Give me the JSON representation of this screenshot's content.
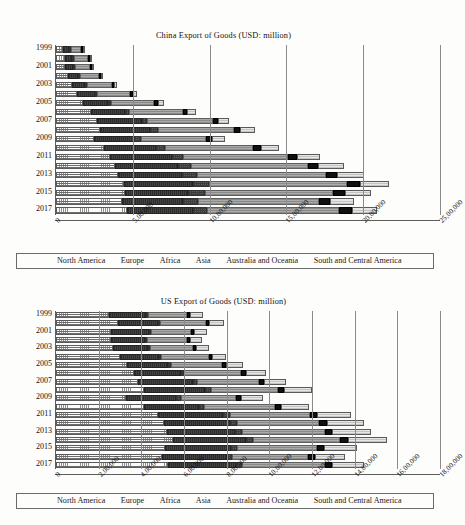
{
  "series_names": [
    "North America",
    "Europe",
    "Africa",
    "Asia",
    "Australia and Oceania",
    "South and Central America"
  ],
  "series_keys": [
    "north-america",
    "europe",
    "africa",
    "asia",
    "australia-oceania",
    "south-central-america"
  ],
  "legend": {
    "items": [
      {
        "label": "North America",
        "key": "north-america"
      },
      {
        "label": "Europe",
        "key": "europe"
      },
      {
        "label": "Africa",
        "key": "africa"
      },
      {
        "label": "Asia",
        "key": "asia"
      },
      {
        "label": "Australia and Oceania",
        "key": "australia-oceania"
      },
      {
        "label": "South and Central America",
        "key": "south-central-america"
      }
    ]
  },
  "chart_data": [
    {
      "id": "china-export",
      "type": "bar",
      "orientation": "horizontal",
      "stacked": true,
      "title": "China Export of Goods (USD: million)",
      "xlabel": "",
      "ylabel": "",
      "xlim": [
        0,
        2500000
      ],
      "xticks": [
        0,
        500000,
        1000000,
        1500000,
        2000000,
        2500000
      ],
      "xtick_labels": [
        "0",
        "5,00,000",
        "10,00,000",
        "15,00,000",
        "20,00,000",
        "25,00,000"
      ],
      "grid": true,
      "legend_position": "bottom",
      "categories": [
        1999,
        2000,
        2001,
        2002,
        2003,
        2004,
        2005,
        2006,
        2007,
        2008,
        2009,
        2010,
        2011,
        2012,
        2013,
        2014,
        2015,
        2016,
        2017
      ],
      "ytick_labels": [
        "1999",
        "2001",
        "2003",
        "2005",
        "2007",
        "2009",
        "2011",
        "2013",
        "2015",
        "2017"
      ],
      "series": [
        {
          "name": "North America",
          "values": [
            45000,
            58000,
            60000,
            78000,
            102000,
            135000,
            177000,
            230000,
            268000,
            285000,
            246000,
            312000,
            350000,
            382000,
            403000,
            440000,
            450000,
            430000,
            460000
          ]
        },
        {
          "name": "Europe",
          "values": [
            38000,
            48000,
            50000,
            66000,
            88000,
            120000,
            163000,
            218000,
            290000,
            330000,
            260000,
            340000,
            406000,
            412000,
            420000,
            450000,
            412000,
            400000,
            430000
          ]
        },
        {
          "name": "Africa",
          "values": [
            4000,
            5000,
            6000,
            7000,
            10000,
            14000,
            19000,
            27000,
            37000,
            51000,
            48000,
            60000,
            73000,
            85000,
            93000,
            106000,
            109000,
            92000,
            95000
          ]
        },
        {
          "name": "Asia",
          "values": [
            70000,
            92000,
            96000,
            122000,
            160000,
            215000,
            282000,
            350000,
            425000,
            490000,
            420000,
            570000,
            680000,
            760000,
            840000,
            900000,
            830000,
            790000,
            860000
          ]
        },
        {
          "name": "Australia and Oceania",
          "values": [
            5000,
            6000,
            7000,
            9000,
            12000,
            16000,
            22000,
            29000,
            36000,
            44000,
            39000,
            52000,
            62000,
            70000,
            76000,
            82000,
            80000,
            74000,
            80000
          ]
        },
        {
          "name": "South and Central America",
          "values": [
            8000,
            10000,
            11000,
            14000,
            20000,
            28000,
            40000,
            55000,
            73000,
            97000,
            85000,
            120000,
            150000,
            165000,
            175000,
            190000,
            172000,
            155000,
            168000
          ]
        }
      ],
      "totals": [
        170000,
        219000,
        230000,
        296000,
        392000,
        528000,
        703000,
        909000,
        1129000,
        1297000,
        1098000,
        1454000,
        1721000,
        1874000,
        2007000,
        2168000,
        2053000,
        1941000,
        2093000
      ]
    },
    {
      "id": "us-export",
      "type": "bar",
      "orientation": "horizontal",
      "stacked": true,
      "title": "US Export of Goods (USD: million)",
      "xlabel": "",
      "ylabel": "",
      "xlim": [
        0,
        1800000
      ],
      "xticks": [
        0,
        200000,
        400000,
        600000,
        800000,
        1000000,
        1200000,
        1400000,
        1600000,
        1800000
      ],
      "xtick_labels": [
        "0",
        "2,00,000",
        "4,00,000",
        "6,00,000",
        "8,00,000",
        "10,00,000",
        "12,00,000",
        "14,00,000",
        "16,00,000",
        "18,00,000"
      ],
      "grid": true,
      "legend_position": "bottom",
      "categories": [
        1999,
        2000,
        2001,
        2002,
        2003,
        2004,
        2005,
        2006,
        2007,
        2008,
        2009,
        2010,
        2011,
        2012,
        2013,
        2014,
        2015,
        2016,
        2017
      ],
      "ytick_labels": [
        "1999",
        "2001",
        "2003",
        "2005",
        "2007",
        "2009",
        "2011",
        "2013",
        "2015",
        "2017"
      ],
      "series": [
        {
          "name": "North America",
          "values": [
            250000,
            291000,
            260000,
            259000,
            267000,
            301000,
            332000,
            364000,
            385000,
            412000,
            330000,
            412000,
            479000,
            505000,
            519000,
            548000,
            513000,
            498000,
            525000
          ]
        },
        {
          "name": "Europe",
          "values": [
            170000,
            186000,
            176000,
            160000,
            165000,
            180000,
            193000,
            222000,
            258000,
            288000,
            234000,
            258000,
            302000,
            310000,
            319000,
            341000,
            307000,
            305000,
            320000
          ]
        },
        {
          "name": "Africa",
          "values": [
            7000,
            9000,
            9000,
            7000,
            8000,
            10000,
            12000,
            15000,
            19000,
            27000,
            22000,
            25000,
            33000,
            35000,
            33000,
            35000,
            28000,
            23000,
            25000
          ]
        },
        {
          "name": "Asia",
          "values": [
            185000,
            216000,
            188000,
            187000,
            201000,
            224000,
            242000,
            268000,
            288000,
            315000,
            257000,
            332000,
            375000,
            383000,
            389000,
            406000,
            375000,
            355000,
            390000
          ]
        },
        {
          "name": "Australia and Oceania",
          "values": [
            15000,
            17000,
            14000,
            15000,
            16000,
            18000,
            20000,
            23000,
            25000,
            28000,
            24000,
            28000,
            33000,
            36000,
            36000,
            38000,
            34000,
            32000,
            34000
          ]
        },
        {
          "name": "South and Central America",
          "values": [
            60000,
            70000,
            62000,
            55000,
            57000,
            66000,
            77000,
            92000,
            105000,
            130000,
            105000,
            130000,
            163000,
            175000,
            179000,
            182000,
            155000,
            142000,
            150000
          ]
        }
      ],
      "totals": [
        687000,
        789000,
        709000,
        683000,
        714000,
        799000,
        876000,
        984000,
        1080000,
        1200000,
        972000,
        1185000,
        1385000,
        1444000,
        1475000,
        1550000,
        1412000,
        1355000,
        1444000
      ]
    }
  ]
}
